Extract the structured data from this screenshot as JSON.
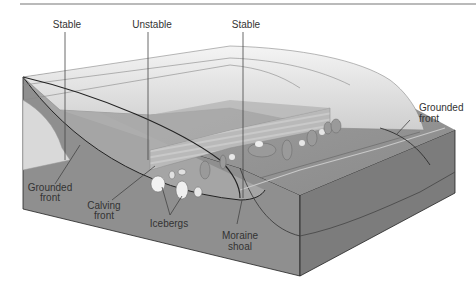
{
  "diagram": {
    "colors": {
      "background": "#ffffff",
      "top_rule": "#777777",
      "ice_light": "#ededed",
      "ice_mid": "#d6d6d6",
      "ice_shadow": "#bdbdbd",
      "water": "#9a9a9a",
      "seabed_front": "#8e8e8e",
      "sediment_side": "#7d7d7d",
      "outline": "#222222",
      "text": "#333333"
    },
    "labels": {
      "stable_left": "Stable",
      "unstable": "Unstable",
      "stable_right": "Stable",
      "grounded_front_right_1": "Grounded",
      "grounded_front_right_2": "front",
      "grounded_front_left_1": "Grounded",
      "grounded_front_left_2": "front",
      "calving_front_1": "Calving",
      "calving_front_2": "front",
      "icebergs": "Icebergs",
      "moraine_shoal_1": "Moraine",
      "moraine_shoal_2": "shoal"
    }
  }
}
